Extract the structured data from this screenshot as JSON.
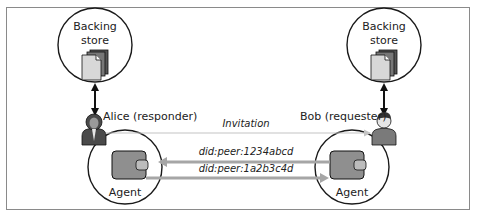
{
  "diagram": {
    "left_store": {
      "line1": "Backing",
      "line2": "store"
    },
    "right_store": {
      "line1": "Backing",
      "line2": "store"
    },
    "alice": {
      "label": "Alice (responder)"
    },
    "bob": {
      "label": "Bob (requester)"
    },
    "left_agent": {
      "label": "Agent"
    },
    "right_agent": {
      "label": "Agent"
    },
    "messages": [
      {
        "label": "Invitation",
        "direction": "alice-to-bob",
        "style": "thin-gray"
      },
      {
        "label": "did:peer:1234abcd",
        "direction": "bob-to-alice",
        "style": "thick-gray"
      },
      {
        "label": "did:peer:1a2b3c4d",
        "direction": "alice-to-bob",
        "style": "thick-gray"
      }
    ],
    "colors": {
      "outline": "#1a1a1a",
      "wallet_fill": "#8f8f8f",
      "arrow_gray": "#a6a6a6",
      "thin_arrow": "#c4c4c4",
      "person_dark": "#4a4a4a",
      "person_face": "#e6e6e6",
      "frame": "#8a8a8a"
    }
  }
}
